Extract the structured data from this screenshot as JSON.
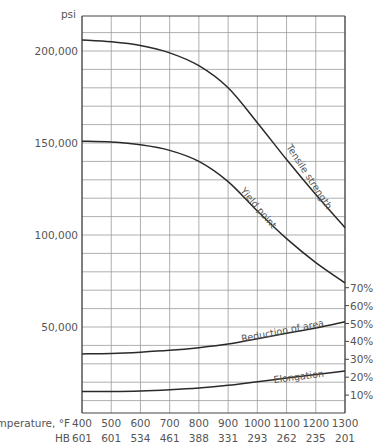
{
  "chart_data": {
    "type": "line",
    "title": "",
    "xlabel": "Temperature, °F",
    "secondary_xlabel": "HB",
    "ylabel": "psi",
    "secondary_ylabel": "%",
    "x": [
      400,
      500,
      600,
      700,
      800,
      900,
      1000,
      1100,
      1200,
      1300
    ],
    "x_tick_labels": [
      "400",
      "500",
      "600",
      "700",
      "800",
      "900",
      "1000",
      "1100",
      "1200",
      "1300"
    ],
    "hb_labels": [
      "601",
      "601",
      "534",
      "461",
      "388",
      "331",
      "293",
      "262",
      "235",
      "201"
    ],
    "y_tick_labels": [
      "200,000",
      "150,000",
      "100,000",
      "50,000"
    ],
    "y_ticks": [
      200000,
      150000,
      100000,
      50000
    ],
    "y2_tick_labels": [
      "70%",
      "60%",
      "50%",
      "40%",
      "30%",
      "20%",
      "10%"
    ],
    "y2_ticks": [
      70,
      60,
      50,
      40,
      30,
      20,
      10
    ],
    "grid": true,
    "legend": "inline curve labels",
    "series": [
      {
        "name": "Tensile strength",
        "axis": "psi",
        "values": [
          206000,
          205000,
          203000,
          199000,
          192000,
          180000,
          161000,
          141000,
          122000,
          104000
        ]
      },
      {
        "name": "Yield point",
        "axis": "psi",
        "values": [
          151000,
          150500,
          149000,
          146000,
          140000,
          129000,
          113000,
          98000,
          85000,
          74000
        ]
      },
      {
        "name": "Reduction of area",
        "axis": "percent",
        "values": [
          33,
          33.3,
          34,
          35,
          36.5,
          38.5,
          41.5,
          44.5,
          47.5,
          51
        ]
      },
      {
        "name": "Elongation",
        "axis": "percent",
        "values": [
          12,
          12,
          12.3,
          13,
          14,
          15.5,
          17.5,
          19.5,
          21.5,
          23.5
        ]
      }
    ]
  },
  "labels": {
    "psi": "psi",
    "temperature": "Temperature, °F",
    "hb": "HB",
    "tensile": "Tensile strength",
    "yield": "Yield point",
    "reduction": "Reduction of area",
    "elongation": "Elongation"
  }
}
